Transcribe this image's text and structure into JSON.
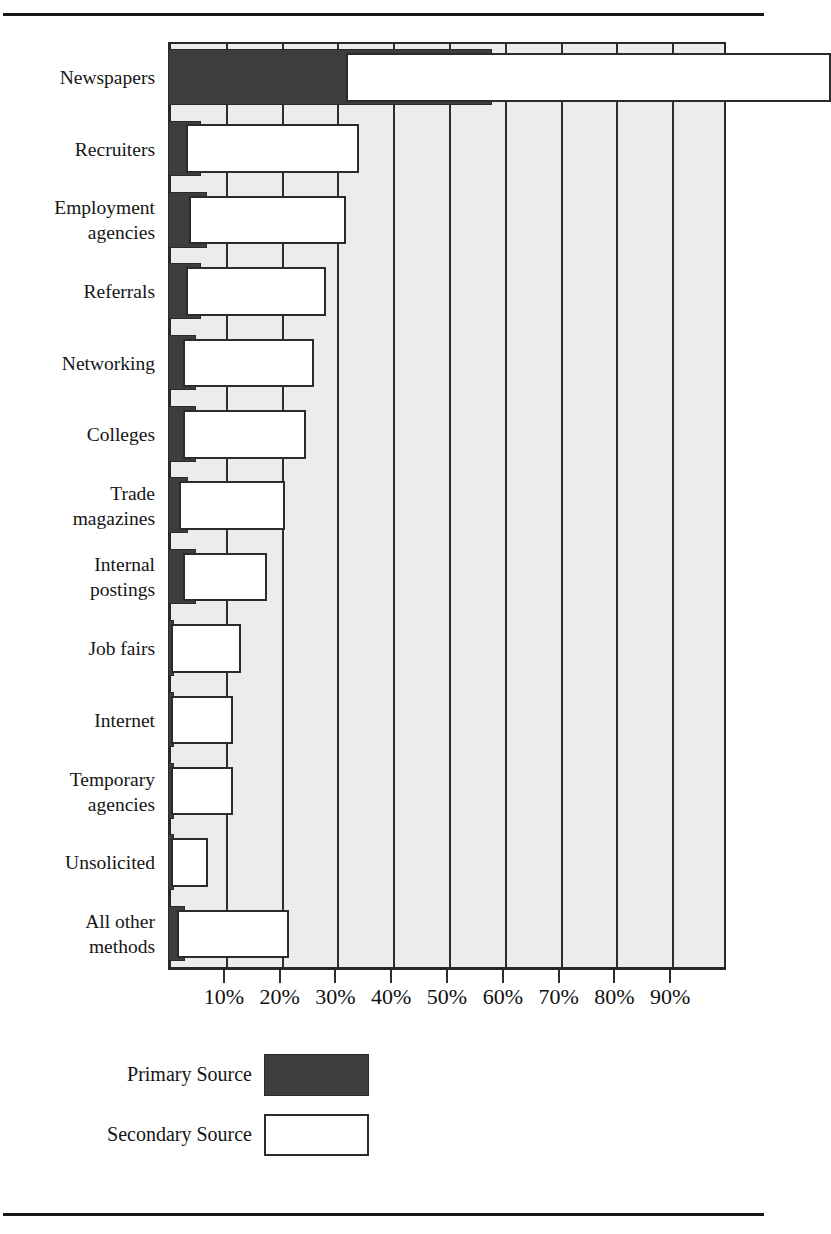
{
  "page": {
    "title_remnant": "",
    "rules": [
      "top-rule",
      "bottom-rule"
    ]
  },
  "legend": {
    "position": "below-plot-left",
    "items": [
      {
        "label": "Primary Source",
        "swatch": "dark-filled-square",
        "color": "#3d3d3d"
      },
      {
        "label": "Secondary Source",
        "swatch": "white-outlined-square",
        "color": "#ffffff"
      }
    ]
  },
  "axis": {
    "x_tick_labels": [
      "10%",
      "20%",
      "30%",
      "40%",
      "50%",
      "60%",
      "70%",
      "80%",
      "90%"
    ]
  },
  "chart_data": {
    "type": "bar",
    "orientation": "horizontal",
    "title": "",
    "subtitle": "",
    "xlabel": "",
    "ylabel": "",
    "xlim": [
      0,
      100
    ],
    "xtick_labels": [
      "10%",
      "20%",
      "30%",
      "40%",
      "50%",
      "60%",
      "70%",
      "80%",
      "90%"
    ],
    "xtick_values": [
      10,
      20,
      30,
      40,
      50,
      60,
      70,
      80,
      90
    ],
    "grid": "vertical",
    "legend_position": "below",
    "categories": [
      "Newspapers",
      "Recruiters",
      "Employment agencies",
      "Referrals",
      "Networking",
      "Colleges",
      "Trade magazines",
      "Internal postings",
      "Job fairs",
      "Internet",
      "Temporary agencies",
      "Unsolicited",
      "All other methods"
    ],
    "series": [
      {
        "name": "Primary Source",
        "color": "#3d3d3d",
        "values": [
          58,
          6,
          7,
          6,
          5,
          5,
          3.5,
          5,
          1,
          1,
          1,
          1,
          3
        ]
      },
      {
        "name": "Secondary Source",
        "color": "#ffffff",
        "values": [
          87,
          31,
          28,
          25,
          23.5,
          22,
          19,
          15,
          12.5,
          11,
          11,
          6.5,
          20
        ]
      }
    ]
  },
  "category_labels": [
    {
      "lines": [
        "Newspapers"
      ]
    },
    {
      "lines": [
        "Recruiters"
      ]
    },
    {
      "lines": [
        "Employment",
        "agencies"
      ]
    },
    {
      "lines": [
        "Referrals"
      ]
    },
    {
      "lines": [
        "Networking"
      ]
    },
    {
      "lines": [
        "Colleges"
      ]
    },
    {
      "lines": [
        "Trade",
        "magazines"
      ]
    },
    {
      "lines": [
        "Internal",
        "postings"
      ]
    },
    {
      "lines": [
        "Job fairs"
      ]
    },
    {
      "lines": [
        "Internet"
      ]
    },
    {
      "lines": [
        "Temporary",
        "agencies"
      ]
    },
    {
      "lines": [
        "Unsolicited"
      ]
    },
    {
      "lines": [
        "All other",
        "methods"
      ]
    }
  ]
}
